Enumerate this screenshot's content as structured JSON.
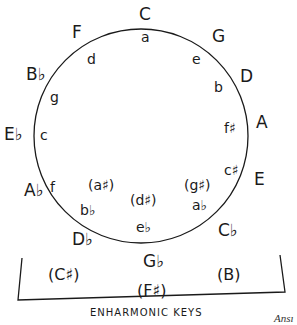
{
  "diagram": {
    "circle": {
      "cx": 141,
      "cy": 136,
      "r": 107,
      "stroke": "#1a1a1a"
    },
    "major_keys": [
      {
        "label": "C",
        "x": 139,
        "y": 20
      },
      {
        "label": "G",
        "x": 212,
        "y": 42
      },
      {
        "label": "D",
        "x": 240,
        "y": 82
      },
      {
        "label": "A",
        "x": 256,
        "y": 128
      },
      {
        "label": "E",
        "x": 254,
        "y": 185
      },
      {
        "label": "Cb",
        "x": 218,
        "y": 236
      },
      {
        "label": "Gb",
        "x": 143,
        "y": 267
      },
      {
        "label": "Db",
        "x": 72,
        "y": 245
      },
      {
        "label": "Ab",
        "x": 24,
        "y": 196
      },
      {
        "label": "Eb",
        "x": 4,
        "y": 140
      },
      {
        "label": "Bb",
        "x": 26,
        "y": 80
      },
      {
        "label": "F",
        "x": 72,
        "y": 38
      }
    ],
    "minor_keys": [
      {
        "label": "a",
        "x": 141,
        "y": 42
      },
      {
        "label": "e",
        "x": 192,
        "y": 64
      },
      {
        "label": "b",
        "x": 214,
        "y": 92
      },
      {
        "label": "f#",
        "x": 224,
        "y": 133
      },
      {
        "label": "c#",
        "x": 224,
        "y": 175
      },
      {
        "label": "ab",
        "x": 192,
        "y": 210
      },
      {
        "label": "eb",
        "x": 136,
        "y": 232
      },
      {
        "label": "bb",
        "x": 80,
        "y": 215
      },
      {
        "label": "f",
        "x": 50,
        "y": 192
      },
      {
        "label": "c",
        "x": 40,
        "y": 140
      },
      {
        "label": "g",
        "x": 50,
        "y": 102
      },
      {
        "label": "d",
        "x": 87,
        "y": 64
      }
    ],
    "enharmonic_minor_keys": [
      {
        "label": "(a#)",
        "x": 88,
        "y": 190
      },
      {
        "label": "(d#)",
        "x": 130,
        "y": 205
      },
      {
        "label": "(g#)",
        "x": 184,
        "y": 190
      }
    ],
    "enharmonic_major_keys": [
      {
        "label": "(C#)",
        "x": 48,
        "y": 280
      },
      {
        "label": "(F#)",
        "x": 137,
        "y": 296
      },
      {
        "label": "(B)",
        "x": 217,
        "y": 280
      }
    ],
    "bracket_label": "ENHARMONIC KEYS",
    "caption": "Ansı"
  }
}
